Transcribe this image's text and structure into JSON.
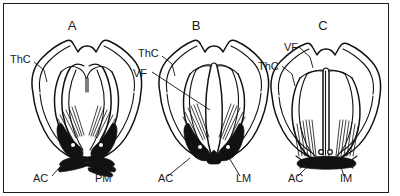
{
  "figure": {
    "border_color": "#1a1a1a",
    "background_color": "#ffffff",
    "ink_color": "#111111"
  },
  "panels": [
    {
      "id": "A",
      "letter": "A",
      "letter_x": 72,
      "letter_y": 30,
      "labels": [
        {
          "key": "ThC",
          "text": "ThC",
          "x": 10,
          "y": 63
        },
        {
          "key": "AC",
          "text": "AC",
          "x": 33,
          "y": 182
        },
        {
          "key": "PM",
          "text": "PM",
          "x": 95,
          "y": 182
        }
      ]
    },
    {
      "id": "B",
      "letter": "B",
      "letter_x": 196,
      "letter_y": 30,
      "labels": [
        {
          "key": "ThC",
          "text": "ThC",
          "x": 138,
          "y": 57
        },
        {
          "key": "VF",
          "text": "VF",
          "x": 133,
          "y": 77
        },
        {
          "key": "AC",
          "text": "AC",
          "x": 158,
          "y": 182
        },
        {
          "key": "LM",
          "text": "LM",
          "x": 236,
          "y": 182
        }
      ]
    },
    {
      "id": "C",
      "letter": "C",
      "letter_x": 323,
      "letter_y": 30,
      "labels": [
        {
          "key": "VF",
          "text": "VF",
          "x": 284,
          "y": 51
        },
        {
          "key": "ThC",
          "text": "ThC",
          "x": 258,
          "y": 70
        },
        {
          "key": "AC",
          "text": "AC",
          "x": 288,
          "y": 182
        },
        {
          "key": "IM",
          "text": "IM",
          "x": 340,
          "y": 182
        }
      ]
    }
  ],
  "legend_keys": {
    "ThC": "ThC",
    "VF": "VF",
    "AC": "AC",
    "PM": "PM",
    "LM": "LM",
    "IM": "IM"
  }
}
